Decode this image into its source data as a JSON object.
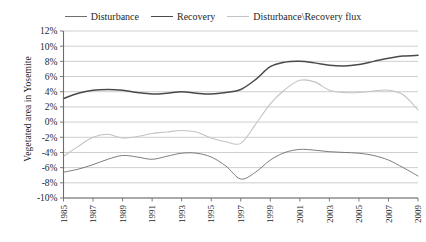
{
  "chart_data": {
    "type": "line",
    "title": "",
    "xlabel": "",
    "ylabel": "Vegetated area in Yosemite",
    "xlim": [
      1985,
      2009
    ],
    "ylim": [
      -10,
      12
    ],
    "ytick_step": 2,
    "xtick_step": 2,
    "grid": true,
    "legend_position": "top-center",
    "ytick_labels": [
      "12%",
      "10%",
      "8%",
      "6%",
      "4%",
      "2%",
      "0%",
      "-2%",
      "-4%",
      "-6%",
      "-8%",
      "-10%"
    ],
    "ytick_values": [
      12,
      10,
      8,
      6,
      4,
      2,
      0,
      -2,
      -4,
      -6,
      -8,
      -10
    ],
    "xtick_labels": [
      "1985",
      "1987",
      "1989",
      "1991",
      "1993",
      "1995",
      "1997",
      "1999",
      "2001",
      "2003",
      "2005",
      "2007",
      "2009"
    ],
    "xtick_values": [
      1985,
      1987,
      1989,
      1991,
      1993,
      1995,
      1997,
      1999,
      2001,
      2003,
      2005,
      2007,
      2009
    ],
    "x": [
      1985,
      1986,
      1987,
      1988,
      1989,
      1990,
      1991,
      1992,
      1993,
      1994,
      1995,
      1996,
      1997,
      1998,
      1999,
      2000,
      2001,
      2002,
      2003,
      2004,
      2005,
      2006,
      2007,
      2008,
      2009
    ],
    "series": [
      {
        "name": "Disturbance",
        "color": "#6e6e6e",
        "width": 0.9,
        "values": [
          -6.6,
          -6.2,
          -5.6,
          -4.9,
          -4.4,
          -4.6,
          -4.9,
          -4.5,
          -4.1,
          -4.1,
          -4.6,
          -5.8,
          -7.5,
          -6.6,
          -5.0,
          -4.0,
          -3.6,
          -3.7,
          -3.9,
          -4.0,
          -4.1,
          -4.4,
          -5.0,
          -6.0,
          -7.1
        ]
      },
      {
        "name": "Recovery",
        "color": "#4a4a4a",
        "width": 1.5,
        "values": [
          3.1,
          3.8,
          4.2,
          4.3,
          4.2,
          3.9,
          3.7,
          3.8,
          4.0,
          3.8,
          3.7,
          3.9,
          4.3,
          5.6,
          7.3,
          7.9,
          8.0,
          7.8,
          7.5,
          7.4,
          7.6,
          8.0,
          8.4,
          8.7,
          8.8
        ]
      },
      {
        "name": "Disturbance\\Recovery flux",
        "color": "#c3c3c3",
        "width": 1.1,
        "values": [
          -4.5,
          -3.2,
          -2.0,
          -1.6,
          -2.1,
          -1.9,
          -1.5,
          -1.3,
          -1.1,
          -1.3,
          -2.1,
          -2.6,
          -2.8,
          -0.3,
          2.4,
          4.3,
          5.5,
          5.3,
          4.2,
          3.9,
          3.9,
          4.1,
          4.2,
          3.6,
          1.6
        ]
      }
    ]
  },
  "legend": {
    "entries": [
      {
        "label": "Disturbance",
        "color": "#6e6e6e",
        "width": "0.9px"
      },
      {
        "label": "Recovery",
        "color": "#4a4a4a",
        "width": "1.6px"
      },
      {
        "label": "Disturbance\\Recovery flux",
        "color": "#c3c3c3",
        "width": "1.2px"
      }
    ]
  },
  "axis": {
    "y_title": "Vegetated area in Yosemite"
  }
}
